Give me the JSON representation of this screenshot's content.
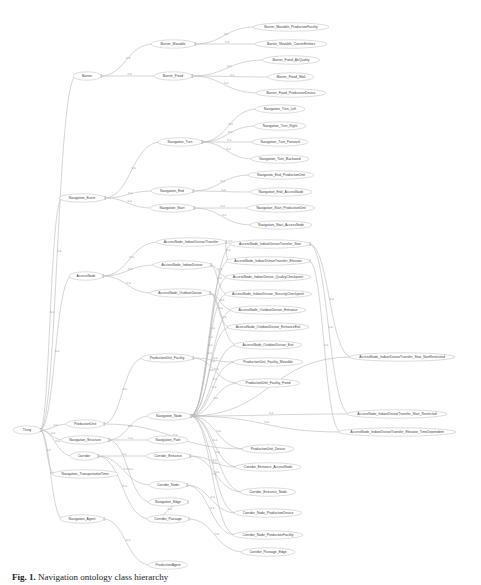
{
  "figure": {
    "caption_label": "Fig. 1.",
    "caption_text": "Navigation ontology class hierarchy"
  },
  "graph": {
    "edge_label": "is-a",
    "nodes": [
      {
        "id": "thing",
        "label": "Thing",
        "x": 27,
        "y": 430,
        "w": 22
      },
      {
        "id": "barrier",
        "label": "Barrier",
        "x": 87,
        "y": 76,
        "w": 22
      },
      {
        "id": "barrier_movable",
        "label": "Barrier_Movable",
        "x": 173,
        "y": 44,
        "w": 38
      },
      {
        "id": "barrier_fixed",
        "label": "Barrier_Fixed",
        "x": 173,
        "y": 76,
        "w": 32
      },
      {
        "id": "bm_pf",
        "label": "Barrier_Movable_ProductionFacility",
        "x": 291,
        "y": 27,
        "w": 70
      },
      {
        "id": "bm_ce",
        "label": "Barrier_Movable_CarrierEntities",
        "x": 291,
        "y": 44,
        "w": 66
      },
      {
        "id": "bf_aq",
        "label": "Barrier_Fixed_AirQuality",
        "x": 291,
        "y": 60,
        "w": 52
      },
      {
        "id": "bf_wall",
        "label": "Barrier_Fixed_Wall",
        "x": 291,
        "y": 77,
        "w": 40
      },
      {
        "id": "bf_pd",
        "label": "Barrier_Fixed_ProductionDevice",
        "x": 291,
        "y": 93,
        "w": 64
      },
      {
        "id": "nav_turn",
        "label": "Navigation_Turn",
        "x": 180,
        "y": 142,
        "w": 38
      },
      {
        "id": "nt_left",
        "label": "Navigation_Turn_Left",
        "x": 280,
        "y": 109,
        "w": 44
      },
      {
        "id": "nt_right",
        "label": "Navigation_Turn_Right",
        "x": 280,
        "y": 126,
        "w": 46
      },
      {
        "id": "nt_forward",
        "label": "Navigation_Turn_Forward",
        "x": 280,
        "y": 142,
        "w": 50
      },
      {
        "id": "nt_backward",
        "label": "Navigation_Turn_Backward",
        "x": 280,
        "y": 159,
        "w": 52
      },
      {
        "id": "nav_event",
        "label": "Navigation_Event",
        "x": 82,
        "y": 198,
        "w": 40
      },
      {
        "id": "nav_end",
        "label": "Navigation_End",
        "x": 172,
        "y": 191,
        "w": 36
      },
      {
        "id": "nav_start",
        "label": "Navigation_Start",
        "x": 172,
        "y": 208,
        "w": 38
      },
      {
        "id": "ne_pu",
        "label": "Navigation_End_ProductionUnit",
        "x": 281,
        "y": 175,
        "w": 60
      },
      {
        "id": "ne_an",
        "label": "Navigation_End_AccessNode",
        "x": 281,
        "y": 192,
        "w": 56
      },
      {
        "id": "ns_pu",
        "label": "Navigation_Start_ProductionUnit",
        "x": 281,
        "y": 208,
        "w": 62
      },
      {
        "id": "ns_an",
        "label": "Navigation_Start_AccessNode",
        "x": 281,
        "y": 225,
        "w": 56
      },
      {
        "id": "access_node",
        "label": "AccessNode",
        "x": 86,
        "y": 276,
        "w": 28
      },
      {
        "id": "an_ift",
        "label": "AccessNode_IndoorDivisor/Transfer",
        "x": 191,
        "y": 242,
        "w": 64
      },
      {
        "id": "an_id",
        "label": "AccessNode_IndoorDivisor",
        "x": 182,
        "y": 265,
        "w": 52
      },
      {
        "id": "an_od",
        "label": "AccessNode_OutdoorDivisor",
        "x": 180,
        "y": 293,
        "w": 54
      },
      {
        "id": "an_ift_stair",
        "label": "AccessNode_IndoorDivisorTransfer_Stair",
        "x": 270,
        "y": 244,
        "w": 74
      },
      {
        "id": "an_ift_elev",
        "label": "AccessNode_IndoorDivisorTransfer_Elevator",
        "x": 268,
        "y": 261,
        "w": 78
      },
      {
        "id": "an_id_qc",
        "label": "AccessNode_IndoorDivisor_QualityCheckpoint",
        "x": 268,
        "y": 277,
        "w": 80
      },
      {
        "id": "an_id_sc",
        "label": "AccessNode_IndoorDivisor_SecurityCheckpoint",
        "x": 268,
        "y": 294,
        "w": 82
      },
      {
        "id": "an_od_entr",
        "label": "AccessNode_OutdoorDivisor_Entrance",
        "x": 268,
        "y": 310,
        "w": 70
      },
      {
        "id": "an_od_entrexit",
        "label": "AccessNode_OutdoorDivisor_EntranceExit",
        "x": 268,
        "y": 327,
        "w": 76
      },
      {
        "id": "an_od_exit",
        "label": "AccessNode_OutdoorDivisor_Exit",
        "x": 268,
        "y": 345,
        "w": 62
      },
      {
        "id": "pu_facility",
        "label": "ProductionUnit_Facility",
        "x": 167,
        "y": 358,
        "w": 46
      },
      {
        "id": "pu_f_movable",
        "label": "ProductionUnit_Facility_Movable",
        "x": 268,
        "y": 362,
        "w": 64
      },
      {
        "id": "pu_f_fixed",
        "label": "ProductionUnit_Facility_Fixed",
        "x": 268,
        "y": 383,
        "w": 58
      },
      {
        "id": "an_stair_nr",
        "label": "AccessNode_IndoorDivisorTransfer_Stair_NonRestricted",
        "x": 402,
        "y": 357,
        "w": 100
      },
      {
        "id": "nav_node",
        "label": "Navigation_Node",
        "x": 169,
        "y": 416,
        "w": 38
      },
      {
        "id": "an_stair_r",
        "label": "AccessNode_IndoorDivisorTransfer_Stair_Restricted",
        "x": 397,
        "y": 414,
        "w": 94
      },
      {
        "id": "an_elev_td",
        "label": "AccessNode_IndoorDivisorTransfer_Elevator_TimeDependent",
        "x": 397,
        "y": 432,
        "w": 112
      },
      {
        "id": "production_unit",
        "label": "ProductionUnit",
        "x": 85,
        "y": 424,
        "w": 32
      },
      {
        "id": "pu_device",
        "label": "ProductionUnit_Device",
        "x": 268,
        "y": 449,
        "w": 46
      },
      {
        "id": "nav_structure",
        "label": "Navigation_Structure",
        "x": 85,
        "y": 440,
        "w": 42
      },
      {
        "id": "nav_path",
        "label": "Navigation_Path",
        "x": 168,
        "y": 440,
        "w": 34
      },
      {
        "id": "ce_an",
        "label": "Corridor_Entrance_AccessNode",
        "x": 268,
        "y": 467,
        "w": 60
      },
      {
        "id": "corridor",
        "label": "Corridor",
        "x": 84,
        "y": 456,
        "w": 22
      },
      {
        "id": "corridor_entrance",
        "label": "Corridor_Entrance",
        "x": 168,
        "y": 456,
        "w": 38
      },
      {
        "id": "ce_node",
        "label": "Corridor_Entrance_Node",
        "x": 268,
        "y": 492,
        "w": 50
      },
      {
        "id": "nav_transport",
        "label": "Navigation_TransportationTime",
        "x": 85,
        "y": 474,
        "w": 60
      },
      {
        "id": "corridor_node",
        "label": "Corridor_Node",
        "x": 168,
        "y": 485,
        "w": 32
      },
      {
        "id": "cn_pd",
        "label": "Corridor_Node_ProductionDevice",
        "x": 268,
        "y": 513,
        "w": 62
      },
      {
        "id": "nav_edge",
        "label": "Navigation_Edge",
        "x": 168,
        "y": 502,
        "w": 34
      },
      {
        "id": "cn_pf",
        "label": "Corridor_Node_ProductionFacility",
        "x": 268,
        "y": 535,
        "w": 64
      },
      {
        "id": "nav_agent",
        "label": "Navigation_Agent",
        "x": 82,
        "y": 519,
        "w": 38
      },
      {
        "id": "corridor_passage",
        "label": "Corridor_Passage",
        "x": 168,
        "y": 519,
        "w": 36
      },
      {
        "id": "cp_edge",
        "label": "Corridor_Passage_Edge",
        "x": 268,
        "y": 552,
        "w": 48
      },
      {
        "id": "production_agent",
        "label": "ProductionAgent",
        "x": 168,
        "y": 565,
        "w": 34
      }
    ],
    "edges": [
      [
        "barrier",
        "thing"
      ],
      [
        "nav_event",
        "thing"
      ],
      [
        "access_node",
        "thing"
      ],
      [
        "production_unit",
        "thing"
      ],
      [
        "nav_structure",
        "thing"
      ],
      [
        "corridor",
        "thing"
      ],
      [
        "nav_transport",
        "thing"
      ],
      [
        "nav_agent",
        "thing"
      ],
      [
        "barrier_movable",
        "barrier"
      ],
      [
        "barrier_fixed",
        "barrier"
      ],
      [
        "bm_pf",
        "barrier_movable"
      ],
      [
        "bm_ce",
        "barrier_movable"
      ],
      [
        "bf_aq",
        "barrier_fixed"
      ],
      [
        "bf_wall",
        "barrier_fixed"
      ],
      [
        "bf_pd",
        "barrier_fixed"
      ],
      [
        "nav_turn",
        "nav_event"
      ],
      [
        "nav_end",
        "nav_event"
      ],
      [
        "nav_start",
        "nav_event"
      ],
      [
        "nt_left",
        "nav_turn"
      ],
      [
        "nt_right",
        "nav_turn"
      ],
      [
        "nt_forward",
        "nav_turn"
      ],
      [
        "nt_backward",
        "nav_turn"
      ],
      [
        "ne_pu",
        "nav_end"
      ],
      [
        "ne_an",
        "nav_end"
      ],
      [
        "ns_pu",
        "nav_start"
      ],
      [
        "ns_an",
        "nav_start"
      ],
      [
        "an_ift",
        "access_node"
      ],
      [
        "an_id",
        "access_node"
      ],
      [
        "an_od",
        "access_node"
      ],
      [
        "an_ift_stair",
        "an_ift"
      ],
      [
        "an_ift_elev",
        "an_ift"
      ],
      [
        "an_id_qc",
        "an_id"
      ],
      [
        "an_id_sc",
        "an_id"
      ],
      [
        "an_od_entr",
        "an_od"
      ],
      [
        "an_od_entrexit",
        "an_od"
      ],
      [
        "an_od_exit",
        "an_od"
      ],
      [
        "an_stair_nr",
        "an_ift_stair"
      ],
      [
        "an_stair_r",
        "an_ift_stair"
      ],
      [
        "an_elev_td",
        "an_ift_elev"
      ],
      [
        "pu_facility",
        "production_unit"
      ],
      [
        "pu_f_movable",
        "pu_facility"
      ],
      [
        "pu_f_fixed",
        "pu_facility"
      ],
      [
        "pu_device",
        "production_unit"
      ],
      [
        "nav_node",
        "nav_structure"
      ],
      [
        "nav_path",
        "nav_structure"
      ],
      [
        "an_ift_stair",
        "nav_node"
      ],
      [
        "an_ift_elev",
        "nav_node"
      ],
      [
        "an_id_qc",
        "nav_node"
      ],
      [
        "an_id_sc",
        "nav_node"
      ],
      [
        "an_od_entr",
        "nav_node"
      ],
      [
        "an_od_entrexit",
        "nav_node"
      ],
      [
        "an_od_exit",
        "nav_node"
      ],
      [
        "pu_f_movable",
        "nav_node"
      ],
      [
        "pu_f_fixed",
        "nav_node"
      ],
      [
        "an_stair_nr",
        "nav_node"
      ],
      [
        "an_stair_r",
        "nav_node"
      ],
      [
        "an_elev_td",
        "nav_node"
      ],
      [
        "pu_device",
        "nav_node"
      ],
      [
        "ce_an",
        "nav_node"
      ],
      [
        "ce_node",
        "nav_node"
      ],
      [
        "cn_pd",
        "nav_node"
      ],
      [
        "cn_pf",
        "nav_node"
      ],
      [
        "corridor_entrance",
        "corridor"
      ],
      [
        "corridor_node",
        "corridor"
      ],
      [
        "corridor_passage",
        "corridor"
      ],
      [
        "ce_an",
        "corridor_entrance"
      ],
      [
        "ce_node",
        "corridor_entrance"
      ],
      [
        "cn_pd",
        "corridor_node"
      ],
      [
        "cn_pf",
        "corridor_node"
      ],
      [
        "nav_edge",
        "nav_structure"
      ],
      [
        "corridor_passage",
        "nav_edge"
      ],
      [
        "cp_edge",
        "corridor_passage"
      ],
      [
        "production_agent",
        "nav_agent"
      ]
    ]
  }
}
